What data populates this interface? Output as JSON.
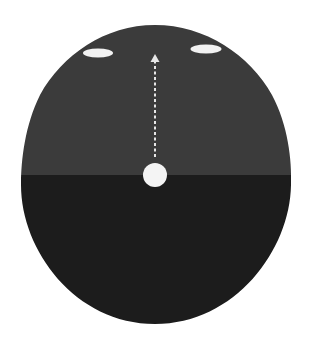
{
  "diagram": {
    "type": "visual-field-schematic",
    "canvas": {
      "width": 311,
      "height": 342,
      "background": "#ffffff"
    },
    "outline": {
      "shape": "egg-oval",
      "top_y": 25,
      "bottom_y": 324,
      "left_x": 21,
      "right_x": 291
    },
    "regions": {
      "upper": {
        "label": "",
        "color": "#3b3b3b"
      },
      "lower": {
        "label": "",
        "color": "#1c1c1c"
      }
    },
    "horizon_y": 175,
    "center_dot": {
      "cx": 155,
      "cy": 175,
      "r": 12,
      "color": "#f4f4f4"
    },
    "ellipses": [
      {
        "name": "left-ellipse",
        "cx": 98,
        "cy": 53,
        "rx": 15,
        "ry": 4.5,
        "color": "#f2f2f2"
      },
      {
        "name": "right-ellipse",
        "cx": 206,
        "cy": 49,
        "rx": 15.5,
        "ry": 4.5,
        "color": "#f2f2f2"
      }
    ],
    "arrow": {
      "x": 155,
      "from_y": 157,
      "to_y": 55,
      "style": "dashed",
      "dash": "3 2.5",
      "color": "#e6e6e6",
      "direction": "up"
    }
  }
}
